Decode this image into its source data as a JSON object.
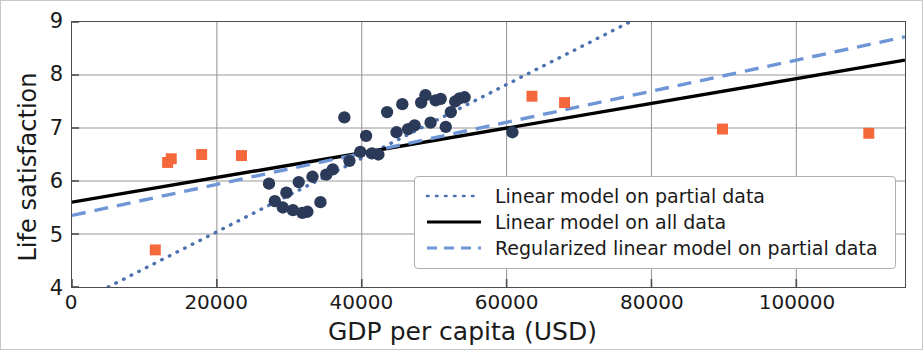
{
  "chart_data": {
    "type": "scatter",
    "title": "",
    "xlabel": "GDP per capita (USD)",
    "ylabel": "Life satisfaction",
    "xlim": [
      0,
      115000
    ],
    "ylim": [
      4,
      9
    ],
    "xticks": [
      0,
      20000,
      40000,
      60000,
      80000,
      100000
    ],
    "xtick_labels": [
      "0",
      "20000",
      "40000",
      "60000",
      "80000",
      "100000"
    ],
    "yticks": [
      4,
      5,
      6,
      7,
      8,
      9
    ],
    "ytick_labels": [
      "4",
      "5",
      "6",
      "7",
      "8",
      "9"
    ],
    "grid": true,
    "legend_position": "lower right",
    "colors": {
      "partial_points": "#2b3a58",
      "missing_points": "#f4683c",
      "dotted_line": "#4c72b0",
      "solid_line": "#000000",
      "dashed_line": "#6e95d6",
      "grid": "#9a9a9a",
      "axes": "#4d4d4d"
    },
    "series": [
      {
        "name": "Partial data (training countries)",
        "marker": "circle",
        "color": "#2b3a58",
        "points": [
          [
            27200,
            5.95
          ],
          [
            28000,
            5.62
          ],
          [
            29100,
            5.5
          ],
          [
            29600,
            5.78
          ],
          [
            30500,
            5.45
          ],
          [
            31300,
            5.98
          ],
          [
            31800,
            5.4
          ],
          [
            32500,
            5.42
          ],
          [
            33200,
            6.08
          ],
          [
            34300,
            5.6
          ],
          [
            35100,
            6.12
          ],
          [
            36000,
            6.22
          ],
          [
            37600,
            7.2
          ],
          [
            38300,
            6.38
          ],
          [
            39800,
            6.55
          ],
          [
            40600,
            6.85
          ],
          [
            41400,
            6.52
          ],
          [
            42300,
            6.5
          ],
          [
            43500,
            7.3
          ],
          [
            44800,
            6.92
          ],
          [
            45600,
            7.45
          ],
          [
            46400,
            6.98
          ],
          [
            47300,
            7.05
          ],
          [
            48200,
            7.48
          ],
          [
            48800,
            7.62
          ],
          [
            49500,
            7.1
          ],
          [
            50200,
            7.52
          ],
          [
            50900,
            7.55
          ],
          [
            51600,
            7.02
          ],
          [
            52300,
            7.3
          ],
          [
            52900,
            7.5
          ],
          [
            53500,
            7.56
          ],
          [
            54200,
            7.58
          ],
          [
            60800,
            6.92
          ]
        ]
      },
      {
        "name": "Missing data (held-out countries)",
        "marker": "square",
        "color": "#f4683c",
        "points": [
          [
            11500,
            4.7
          ],
          [
            13200,
            6.35
          ],
          [
            13700,
            6.42
          ],
          [
            17900,
            6.5
          ],
          [
            23400,
            6.48
          ],
          [
            63500,
            7.6
          ],
          [
            68000,
            7.48
          ],
          [
            89800,
            6.98
          ],
          [
            110000,
            6.9
          ]
        ]
      }
    ],
    "lines": [
      {
        "name": "Linear model on partial data",
        "style": "dotted",
        "color": "#4c72b0",
        "endpoints": [
          [
            5000,
            4.0
          ],
          [
            77000,
            9.0
          ]
        ]
      },
      {
        "name": "Linear model on all data",
        "style": "solid",
        "color": "#000000",
        "endpoints": [
          [
            0,
            5.6
          ],
          [
            115000,
            8.28
          ]
        ]
      },
      {
        "name": "Regularized linear model on partial data",
        "style": "dashed",
        "color": "#6e95d6",
        "endpoints": [
          [
            0,
            5.35
          ],
          [
            115000,
            8.72
          ]
        ]
      }
    ]
  },
  "axes": {
    "ylabel": "Life satisfaction",
    "xlabel": "GDP per capita (USD)",
    "ytick_labels": [
      "9",
      "8",
      "7",
      "6",
      "5",
      "4"
    ],
    "xtick_labels": [
      "0",
      "20000",
      "40000",
      "60000",
      "80000",
      "100000"
    ]
  },
  "legend": {
    "entries": [
      {
        "label": "Linear model on partial data",
        "style": "dotted",
        "color": "#4c72b0"
      },
      {
        "label": "Linear model on all data",
        "style": "solid",
        "color": "#000000"
      },
      {
        "label": "Regularized linear model on partial data",
        "style": "dashed",
        "color": "#6e95d6"
      }
    ]
  }
}
